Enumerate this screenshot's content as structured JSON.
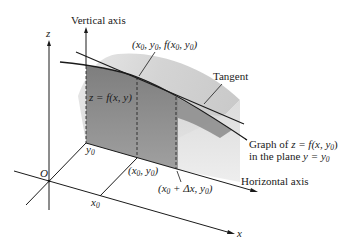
{
  "figure": {
    "labels": {
      "z_axis": "z",
      "x_axis": "x",
      "origin": "O",
      "vertical_axis": "Vertical axis",
      "horizontal_axis": "Horizontal axis",
      "tangent": "Tangent",
      "point_3d": "(x0, y0, f(x0, y0))",
      "surface": "z = f(x, y)",
      "y0": "y0",
      "x0": "x0",
      "point_base": "(x0, y0)",
      "point_base_dx": "(x0 + Δx, y0)",
      "graph_line1": "Graph of z = f(x, y0)",
      "graph_line2": "in the plane y = y0"
    },
    "colors": {
      "surface_light": "#d4d4d4",
      "surface_dark": "#8e8e8e",
      "lines": "#1a1a1a"
    }
  }
}
